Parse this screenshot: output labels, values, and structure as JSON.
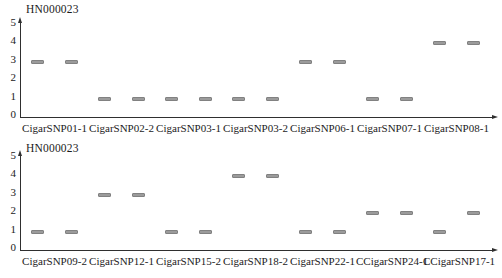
{
  "figure_title": "HN000023",
  "colors": {
    "background": "#ffffff",
    "marker_fill": "#9b9b9b",
    "marker_border": "#818181",
    "axis": "#2f2f2f",
    "text": "#1b1b1b"
  },
  "chart_data": [
    {
      "type": "scatter",
      "title": "HN000023",
      "xlabel": "",
      "ylabel": "",
      "ylim": [
        0,
        5
      ],
      "yticks": [
        0,
        1,
        2,
        3,
        4,
        5
      ],
      "grid": false,
      "legend": "none",
      "marker_style": "short-gray-dash",
      "categories": [
        "CigarSNP01-1",
        "CigarSNP02-2",
        "CigarSNP03-1",
        "CigarSNP03-2",
        "CigarSNP06-1",
        "CigarSNP07-1",
        "CigarSNP08-1"
      ],
      "marker_values_per_category": [
        [
          3,
          3
        ],
        [
          1,
          1
        ],
        [
          1,
          1
        ],
        [
          1,
          1
        ],
        [
          3,
          3
        ],
        [
          1,
          1
        ],
        [
          4,
          4
        ]
      ]
    },
    {
      "type": "scatter",
      "title": "HN000023",
      "xlabel": "",
      "ylabel": "",
      "ylim": [
        0,
        5
      ],
      "yticks": [
        0,
        1,
        2,
        3,
        4,
        5
      ],
      "grid": false,
      "legend": "none",
      "marker_style": "short-gray-dash",
      "categories": [
        "CigarSNP09-2",
        "CigarSNP12-1",
        "CigarSNP15-2",
        "CigarSNP18-2",
        "CigarSNP22-1",
        "CCigarSNP24-1",
        "CCigarSNP17-1"
      ],
      "marker_values_per_category": [
        [
          1,
          1
        ],
        [
          3,
          3
        ],
        [
          1,
          1
        ],
        [
          4,
          4
        ],
        [
          1,
          1
        ],
        [
          2,
          2
        ],
        [
          1,
          2
        ]
      ]
    }
  ]
}
